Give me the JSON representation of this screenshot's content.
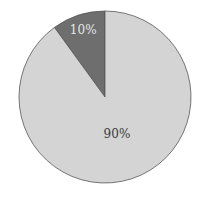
{
  "chart_data": {
    "type": "pie",
    "title": "",
    "categories": [
      "A",
      "B"
    ],
    "values": [
      10,
      90
    ],
    "labels": [
      "10%",
      "90%"
    ],
    "colors": [
      "#6e6e6e",
      "#d4d4d4"
    ],
    "label_colors": [
      "#e8e8e8",
      "#3a3a3a"
    ],
    "start_angle_deg": 90,
    "direction": "counterclockwise",
    "legend": "none"
  }
}
